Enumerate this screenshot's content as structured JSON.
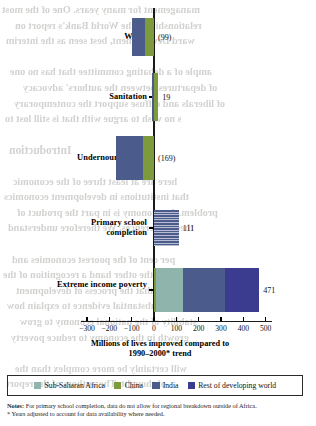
{
  "chart_data": {
    "type": "bar",
    "orientation": "horizontal",
    "title": "",
    "xlabel": "Millions of lives improved compared to 1990–2000* trend",
    "ylabel": "",
    "xlim": [
      -300,
      500
    ],
    "xticks": [
      -300,
      -200,
      -100,
      0,
      100,
      200,
      300,
      400,
      500
    ],
    "xtick_labels": [
      "−300",
      "−200",
      "−100",
      "0",
      "100",
      "200",
      "300",
      "400",
      "500"
    ],
    "grid": false,
    "legend_position": "bottom",
    "categories": [
      "Water",
      "Sanitation",
      "Undernourishment",
      "Primary school completion",
      "Extreme income poverty"
    ],
    "category_totals": [
      -99,
      19,
      -169,
      111,
      471
    ],
    "value_labels": [
      "(99)",
      "19",
      "(169)",
      "111",
      "471"
    ],
    "series": [
      {
        "name": "Sub-Saharan Africa",
        "color": "#8fb4ac",
        "values": [
          0,
          0,
          0,
          0,
          28
        ]
      },
      {
        "name": "China",
        "color": "#7d9a3d",
        "values": [
          -41,
          28,
          -50,
          0,
          9
        ]
      },
      {
        "name": "India",
        "color": "#4a5b8c",
        "values": [
          -58,
          -9,
          -119,
          111,
          185
        ]
      },
      {
        "name": "Rest of developing world",
        "color": "#3b3b8f",
        "values": [
          0,
          0,
          0,
          0,
          249
        ]
      }
    ],
    "bars": [
      {
        "category": "Water",
        "label": "(99)",
        "total": -99,
        "segments": [
          {
            "series": "India",
            "color": "#4a5b8c",
            "from": -99,
            "to": -41
          },
          {
            "series": "China",
            "color": "#7d9a3d",
            "from": -41,
            "to": 0
          }
        ]
      },
      {
        "category": "Sanitation",
        "label": "19",
        "total": 19,
        "segments": [
          {
            "series": "India",
            "color": "#4a5b8c",
            "from": -9,
            "to": 2
          },
          {
            "series": "China",
            "color": "#7d9a3d",
            "from": 2,
            "to": 19
          }
        ]
      },
      {
        "category": "Undernourishment",
        "label": "(169)",
        "total": -169,
        "segments": [
          {
            "series": "India",
            "color": "#4a5b8c",
            "from": -169,
            "to": -50
          },
          {
            "series": "China",
            "color": "#7d9a3d",
            "from": -50,
            "to": 0
          }
        ]
      },
      {
        "category": "Primary school completion",
        "label": "111",
        "total": 111,
        "segments": [
          {
            "series": "India",
            "color": "#4a5b8c",
            "hatched": true,
            "from": 0,
            "to": 111
          }
        ]
      },
      {
        "category": "Extreme income poverty",
        "label": "471",
        "total": 471,
        "segments": [
          {
            "series": "China",
            "color": "#7d9a3d",
            "from": 0,
            "to": 9
          },
          {
            "series": "Sub-Saharan Africa",
            "color": "#8fb4ac",
            "from": 9,
            "to": 130
          },
          {
            "series": "India",
            "color": "#4a5b8c",
            "from": 130,
            "to": 320
          },
          {
            "series": "Rest of developing world",
            "color": "#3b3b8f",
            "from": 320,
            "to": 471
          }
        ]
      }
    ]
  },
  "axis": {
    "title_line1": "Millions of lives improved compared to",
    "title_line2": "1990–2000* trend"
  },
  "legend": {
    "items": [
      {
        "label": "Sub-Saharan Africa",
        "color": "#8fb4ac"
      },
      {
        "label": "China",
        "color": "#7d9a3d"
      },
      {
        "label": "India",
        "color": "#4a5b8c"
      },
      {
        "label": "Rest of developing world",
        "color": "#3b3b8f"
      }
    ]
  },
  "notes": {
    "lead": "Notes:",
    "line1": " For primary school completion, data do not allow for regional breakdown outside of Africa.",
    "line2": "* Years adjusted to account for data availability where needed."
  },
  "bleed_through": {
    "lines": [
      "management for many years. One of the most",
      "relationships it the World Bank's report on",
      "ward Development, best seen as the interim",
      "",
      "ample of a debating committee that has no one",
      "of departures between the authors' advocacy",
      "of liberals and diffuse support the contemporary",
      "s no wish to argue with that is still lost to",
      "",
      "Introduction",
      "",
      "here are at least three of the economic",
      "that institutions in development economics",
      "problem. An economy is in part the product of",
      "these differences. We therefore understand",
      "",
      "per cent of the poorest economies and",
      "on to the other hand a recognition of the",
      "widely that the process of development",
      "and substantial evidence to explain how",
      "stability of the national economy to grow",
      "growth in the economy to reduce poverty",
      "",
      "will certainly be more complex than the",
      "of thought. The authors of the report"
    ]
  }
}
